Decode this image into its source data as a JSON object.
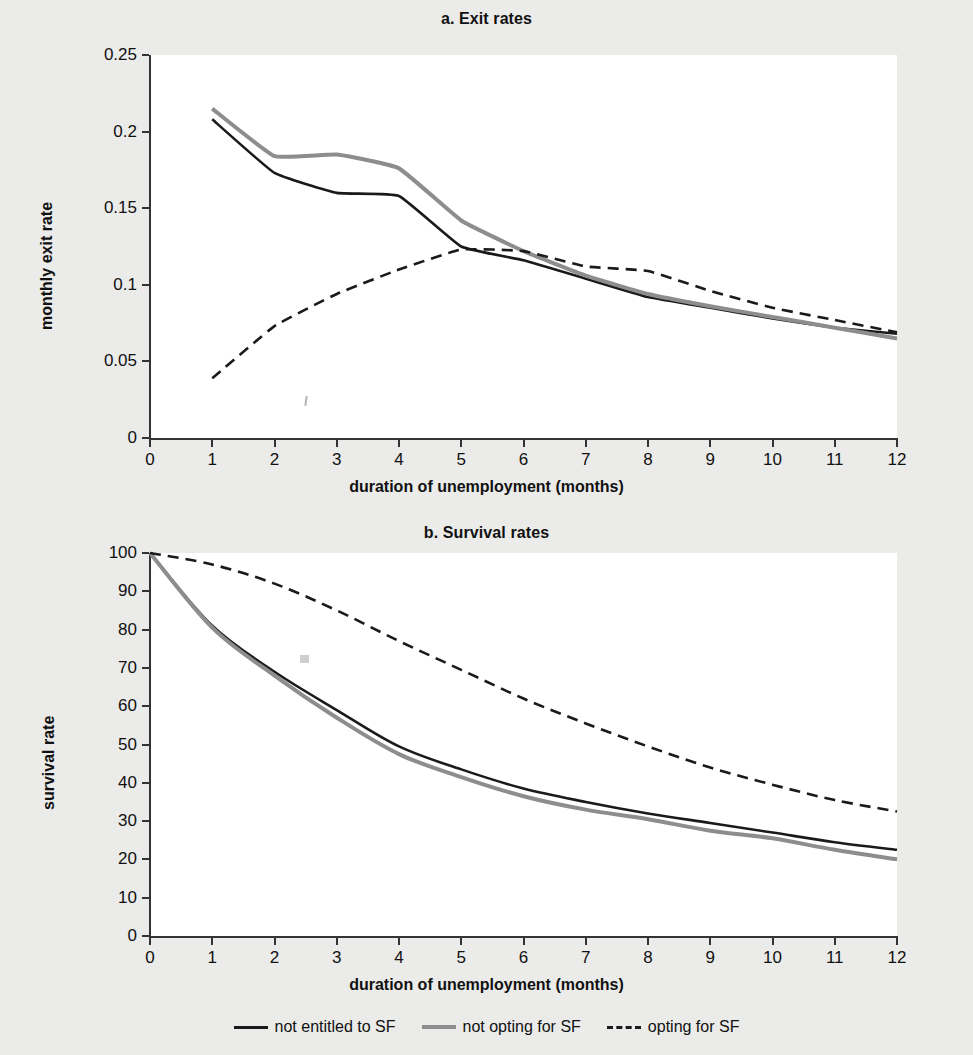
{
  "figure": {
    "background_color": "#ebebe9",
    "plot_background_color": "#ffffff"
  },
  "legend": {
    "position": "bottom-center",
    "items": [
      {
        "label": "not entitled to SF",
        "style": "solid",
        "color": "#1a1a1a"
      },
      {
        "label": "not opting for SF",
        "style": "solid",
        "color": "#8d8d8d"
      },
      {
        "label": "opting for SF",
        "style": "dashed",
        "color": "#1a1a1a"
      }
    ]
  },
  "chart_data": [
    {
      "type": "line",
      "title": "a. Exit rates",
      "xlabel": "duration of unemployment (months)",
      "ylabel": "monthly exit rate",
      "x": [
        1,
        2,
        3,
        4,
        5,
        6,
        7,
        8,
        9,
        10,
        11,
        12
      ],
      "xlim": [
        0,
        12
      ],
      "ylim": [
        0,
        0.25
      ],
      "xticks": [
        "0",
        "1",
        "2",
        "3",
        "4",
        "5",
        "6",
        "7",
        "8",
        "9",
        "10",
        "11",
        "12"
      ],
      "yticks": [
        "0",
        "0.05",
        "0.1",
        "0.15",
        "0.2",
        "0.25"
      ],
      "grid": false,
      "series": [
        {
          "name": "not entitled to SF",
          "style": "solid",
          "color": "#1a1a1a",
          "values": [
            0.208,
            0.173,
            0.16,
            0.158,
            0.125,
            0.116,
            0.104,
            0.092,
            0.085,
            0.078,
            0.072,
            0.068
          ]
        },
        {
          "name": "not opting for SF",
          "style": "solid",
          "color": "#8d8d8d",
          "values": [
            0.215,
            0.184,
            0.185,
            0.176,
            0.142,
            0.122,
            0.106,
            0.094,
            0.086,
            0.079,
            0.072,
            0.065
          ]
        },
        {
          "name": "opting for SF",
          "style": "dashed",
          "color": "#1a1a1a",
          "values": [
            0.039,
            0.073,
            0.094,
            0.11,
            0.123,
            0.122,
            0.112,
            0.109,
            0.096,
            0.085,
            0.077,
            0.069
          ]
        }
      ]
    },
    {
      "type": "line",
      "title": "b. Survival rates",
      "xlabel": "duration of unemployment (months)",
      "ylabel": "survival rate",
      "x": [
        0,
        1,
        2,
        3,
        4,
        5,
        6,
        7,
        8,
        9,
        10,
        11,
        12
      ],
      "xlim": [
        0,
        12
      ],
      "ylim": [
        0,
        100
      ],
      "xticks": [
        "0",
        "1",
        "2",
        "3",
        "4",
        "5",
        "6",
        "7",
        "8",
        "9",
        "10",
        "11",
        "12"
      ],
      "yticks": [
        "0",
        "10",
        "20",
        "30",
        "40",
        "50",
        "60",
        "70",
        "80",
        "90",
        "100"
      ],
      "grid": false,
      "series": [
        {
          "name": "not entitled to SF",
          "style": "solid",
          "color": "#1a1a1a",
          "values": [
            100,
            81,
            69,
            59,
            49.5,
            43.5,
            38.5,
            35,
            32,
            29.5,
            27,
            24.5,
            22.5
          ]
        },
        {
          "name": "not opting for SF",
          "style": "solid",
          "color": "#8d8d8d",
          "values": [
            100,
            80.5,
            68,
            57,
            47.5,
            41.5,
            36.5,
            33,
            30.5,
            27.5,
            25.5,
            22.5,
            20
          ]
        },
        {
          "name": "opting for SF",
          "style": "dashed",
          "color": "#1a1a1a",
          "values": [
            100,
            97,
            92,
            85,
            77,
            69.5,
            62,
            55.5,
            49.5,
            44,
            39.5,
            35.5,
            32.5
          ]
        }
      ]
    }
  ]
}
